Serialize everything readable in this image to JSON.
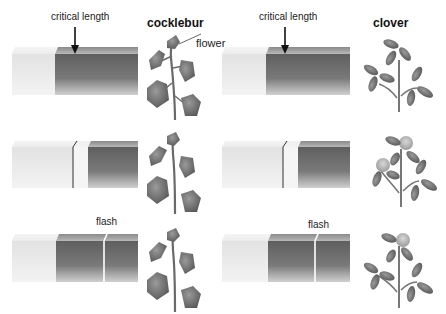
{
  "panels": [
    {
      "plant": "cocklebur",
      "title": "cocklebur",
      "rows": [
        {
          "annotation": "critical length",
          "plant_label": "flower",
          "state": "continuous dark period exceeds critical length",
          "flowering": true
        },
        {
          "annotation": "",
          "state": "dark period interrupted, shorter than critical length",
          "flowering": false
        },
        {
          "annotation": "flash",
          "state": "dark period interrupted by light flash",
          "flowering": false
        }
      ]
    },
    {
      "plant": "clover",
      "title": "clover",
      "rows": [
        {
          "annotation": "critical length",
          "state": "continuous dark period exceeds critical length",
          "flowering": false
        },
        {
          "annotation": "",
          "state": "dark period interrupted, shorter than critical length",
          "flowering": true
        },
        {
          "annotation": "flash",
          "state": "dark period interrupted by light flash",
          "flowering": true
        }
      ]
    }
  ],
  "colors": {
    "light_period": "#ebebeb",
    "dark_period": "#6e6e6e",
    "leaf": "#7a7a7a",
    "flower": "#bdbdbd"
  }
}
